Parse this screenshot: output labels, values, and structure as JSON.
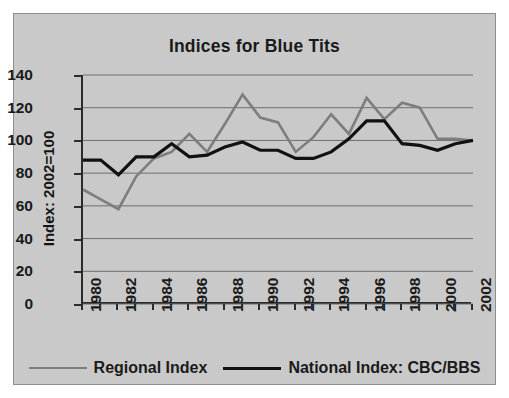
{
  "chart_data": {
    "type": "line",
    "title": "Indices for Blue Tits",
    "xlabel": "",
    "ylabel": "Index: 2002=100",
    "ylim": [
      0,
      140
    ],
    "ytick_step": 20,
    "yticks": [
      140,
      120,
      100,
      80,
      60,
      40,
      20,
      0
    ],
    "xlim": [
      1980,
      2002
    ],
    "x": [
      1980,
      1981,
      1982,
      1983,
      1984,
      1985,
      1986,
      1987,
      1988,
      1989,
      1990,
      1991,
      1992,
      1993,
      1994,
      1995,
      1996,
      1997,
      1998,
      1999,
      2000,
      2001,
      2002
    ],
    "xticks_labeled": [
      "1980",
      "1982",
      "1984",
      "1986",
      "1988",
      "1990",
      "1992",
      "1994",
      "1996",
      "1998",
      "2000",
      "2002"
    ],
    "grid": "horizontal",
    "legend_position": "bottom",
    "series": [
      {
        "name": "Regional Index",
        "color": "#7d7d7d",
        "stroke_width": 2.6,
        "values": [
          70,
          64,
          58,
          78,
          89,
          93,
          104,
          93,
          110,
          128,
          114,
          111,
          93,
          102,
          116,
          104,
          126,
          113,
          123,
          120,
          101,
          101,
          100
        ]
      },
      {
        "name": "National Index: CBC/BBS",
        "color": "#111111",
        "stroke_width": 3.2,
        "values": [
          88,
          88,
          79,
          90,
          90,
          98,
          90,
          91,
          96,
          99,
          94,
          94,
          89,
          89,
          93,
          101,
          112,
          112,
          98,
          97,
          94,
          98,
          100
        ]
      }
    ]
  },
  "legend": {
    "entries": [
      {
        "label": "Regional Index"
      },
      {
        "label": "National Index: CBC/BBS"
      }
    ]
  }
}
